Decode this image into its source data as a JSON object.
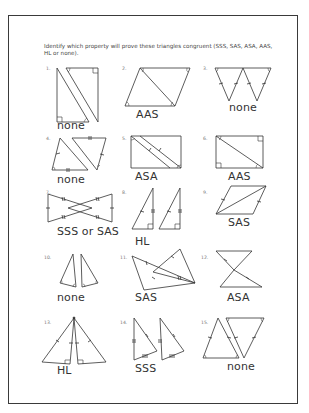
{
  "worksheet": {
    "instructions": "Identify which property will prove these triangles congruent (SSS, SAS, ASA, AAS, HL or none).",
    "problems": [
      {
        "number": "1.",
        "answer": "none"
      },
      {
        "number": "2.",
        "answer": "AAS"
      },
      {
        "number": "3.",
        "answer": "none"
      },
      {
        "number": "4.",
        "answer": "none"
      },
      {
        "number": "5.",
        "answer": "ASA"
      },
      {
        "number": "6.",
        "answer": "AAS"
      },
      {
        "number": "7.",
        "answer": "SSS or SAS"
      },
      {
        "number": "8.",
        "answer": "HL"
      },
      {
        "number": "9.",
        "answer": "SAS"
      },
      {
        "number": "10.",
        "answer": "none"
      },
      {
        "number": "11.",
        "answer": "SAS"
      },
      {
        "number": "12.",
        "answer": "ASA"
      },
      {
        "number": "13.",
        "answer": "HL"
      },
      {
        "number": "14.",
        "answer": "SSS"
      },
      {
        "number": "15.",
        "answer": "none"
      }
    ]
  },
  "colors": {
    "ink": "#333333",
    "border": "#3a3a3a",
    "paper": "#ffffff"
  }
}
